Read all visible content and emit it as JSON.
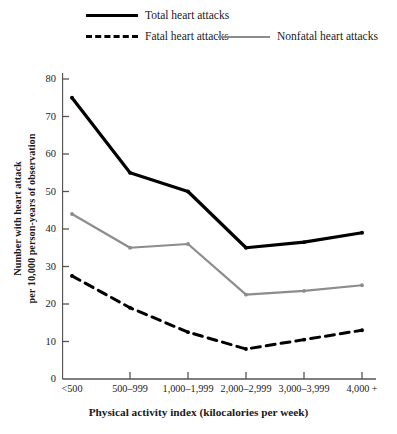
{
  "chart_data": {
    "type": "line",
    "title": "",
    "xlabel": "Physical activity index (kilocalories per week)",
    "ylabel_line1": "Number with heart attack",
    "ylabel_line2": "per 10,000 person-years of observation",
    "categories": [
      "<500",
      "500–999",
      "1,000–1,999",
      "2,000–2,999",
      "3,000–3,999",
      "4,000 +"
    ],
    "xlim": [
      0,
      5
    ],
    "ylim": [
      0,
      80
    ],
    "yticks": [
      0,
      10,
      20,
      30,
      40,
      50,
      60,
      70,
      80
    ],
    "ytick_labels": [
      "0",
      "10",
      "20",
      "30",
      "40",
      "50",
      "60",
      "70",
      "80"
    ],
    "grid": false,
    "legend_position": "top",
    "series": [
      {
        "name": "Total heart attacks",
        "values": [
          75,
          55,
          50,
          35,
          36.5,
          39
        ],
        "color": "#000000",
        "style": "solid",
        "width": 3.2
      },
      {
        "name": "Fatal heart attacks",
        "values": [
          27.5,
          19,
          12.5,
          8,
          10.5,
          13
        ],
        "color": "#000000",
        "style": "dashed",
        "width": 3.0
      },
      {
        "name": "Nonfatal heart attacks",
        "values": [
          44,
          35,
          36,
          22.5,
          23.5,
          25
        ],
        "color": "#8c8c8c",
        "style": "solid",
        "width": 2.2
      }
    ]
  },
  "legend": {
    "items": [
      {
        "label": "Total heart attacks"
      },
      {
        "label": "Fatal heart attacks"
      },
      {
        "label": "Nonfatal heart attacks"
      }
    ]
  },
  "axes": {
    "x_title": "Physical activity index (kilocalories per week)",
    "y_title_line1": "Number with heart attack",
    "y_title_line2": "per 10,000 person-years of observation"
  }
}
